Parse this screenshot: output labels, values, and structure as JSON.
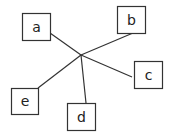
{
  "diagram": {
    "type": "star-graph",
    "colors": {
      "stroke": "#333333",
      "fill": "#ffffff",
      "text": "#222222"
    },
    "hub": {
      "x": 81,
      "y": 55
    },
    "nodes": [
      {
        "id": "a",
        "label": "a",
        "x": 22,
        "y": 13,
        "w": 28,
        "h": 27,
        "edge_end": {
          "x": 50,
          "y": 33
        }
      },
      {
        "id": "b",
        "label": "b",
        "x": 117,
        "y": 6,
        "w": 28,
        "h": 27,
        "edge_end": {
          "x": 133,
          "y": 33
        }
      },
      {
        "id": "c",
        "label": "c",
        "x": 134,
        "y": 61,
        "w": 28,
        "h": 27,
        "edge_end": {
          "x": 132,
          "y": 77
        }
      },
      {
        "id": "d",
        "label": "d",
        "x": 67,
        "y": 103,
        "w": 28,
        "h": 27,
        "edge_end": {
          "x": 86,
          "y": 103
        }
      },
      {
        "id": "e",
        "label": "e",
        "x": 11,
        "y": 88,
        "w": 27,
        "h": 26,
        "edge_end": {
          "x": 38,
          "y": 88
        }
      }
    ]
  }
}
